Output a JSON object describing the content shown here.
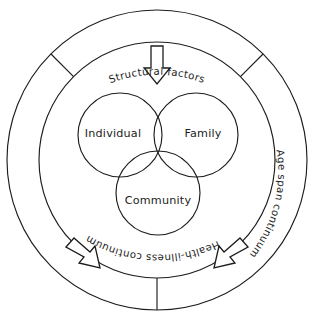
{
  "diagram": {
    "background_color": "#ffffff",
    "line_color": "#1d1d1b",
    "venn": {
      "circles": [
        {
          "id": "individual",
          "label": "Individual",
          "cx": 120,
          "cy": 135,
          "r": 42
        },
        {
          "id": "family",
          "label": "Family",
          "cx": 196,
          "cy": 135,
          "r": 42
        },
        {
          "id": "community",
          "label": "Community",
          "cx": 158,
          "cy": 193,
          "r": 42
        }
      ],
      "label_positions": [
        {
          "id": "individual",
          "x": 113,
          "y": 134
        },
        {
          "id": "family",
          "x": 203,
          "y": 134
        },
        {
          "id": "community",
          "x": 158,
          "y": 201
        }
      ]
    },
    "ring": {
      "center_x": 157,
      "center_y": 160,
      "outer_radius": 150,
      "inner_radius": 118,
      "spoke_angles_deg": [
        135,
        45,
        270
      ],
      "labels": [
        {
          "id": "structural-factors",
          "text": "Structural factors",
          "position": "top"
        },
        {
          "id": "health-illness-continuum",
          "text": "Health-illness continuum",
          "position": "left"
        },
        {
          "id": "age-span-continuum",
          "text": "Age span continuum",
          "position": "right"
        }
      ]
    },
    "arrows": [
      {
        "id": "top-arrow",
        "direction": "down",
        "points_toward": "center"
      },
      {
        "id": "bottom-left-arrow",
        "direction": "up-right",
        "points_toward": "center"
      },
      {
        "id": "bottom-right-arrow",
        "direction": "up-left",
        "points_toward": "center"
      }
    ]
  }
}
